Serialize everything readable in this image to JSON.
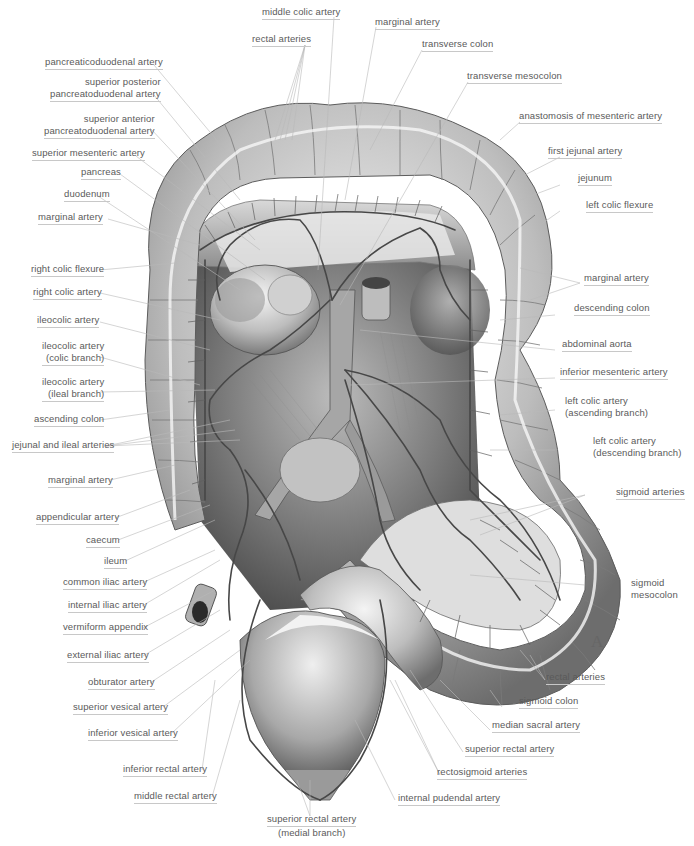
{
  "figure": {
    "panel_letter": "A",
    "style": "grayscale anatomical illustration of the large intestine and its arterial supply, anterior view",
    "colors": {
      "background": "#ffffff",
      "label_text": "#5a5a5a",
      "leader_line": "#b8b8b8",
      "tissue_light": "#e6e6e6",
      "tissue_dark": "#6a6a6a",
      "vessel": "#4a4a4a"
    }
  },
  "labels": {
    "left": [
      {
        "id": "pancreaticoduodenal-artery",
        "text": "pancreaticoduodenal artery"
      },
      {
        "id": "superior-posterior-pancreatoduodenal-artery",
        "line1": "superior posterior",
        "line2": "pancreatoduodenal artery"
      },
      {
        "id": "superior-anterior-pancreatoduodenal-artery",
        "line1": "superior anterior",
        "line2": "pancreatoduodenal artery"
      },
      {
        "id": "superior-mesenteric-artery",
        "text": "superior mesenteric artery"
      },
      {
        "id": "pancreas",
        "text": "pancreas"
      },
      {
        "id": "duodenum",
        "text": "duodenum"
      },
      {
        "id": "marginal-artery-left-upper",
        "text": "marginal artery"
      },
      {
        "id": "right-colic-flexure",
        "text": "right colic flexure"
      },
      {
        "id": "right-colic-artery",
        "text": "right colic artery"
      },
      {
        "id": "ileocolic-artery",
        "text": "ileocolic artery"
      },
      {
        "id": "ileocolic-artery-colic-branch",
        "line1": "ileocolic artery",
        "line2": "(colic branch)"
      },
      {
        "id": "ileocolic-artery-ileal-branch",
        "line1": "ileocolic artery",
        "line2": "(ileal branch)"
      },
      {
        "id": "ascending-colon",
        "text": "ascending colon"
      },
      {
        "id": "jejunal-and-ileal-arteries",
        "text": "jejunal and ileal arteries"
      },
      {
        "id": "marginal-artery-left-lower",
        "text": "marginal artery"
      },
      {
        "id": "appendicular-artery",
        "text": "appendicular artery"
      },
      {
        "id": "caecum",
        "text": "caecum"
      },
      {
        "id": "ileum",
        "text": "ileum"
      },
      {
        "id": "common-iliac-artery",
        "text": "common iliac artery"
      },
      {
        "id": "internal-iliac-artery",
        "text": "internal iliac artery"
      },
      {
        "id": "vermiform-appendix",
        "text": "vermiform appendix"
      },
      {
        "id": "external-iliac-artery",
        "text": "external iliac artery"
      },
      {
        "id": "obturator-artery",
        "text": "obturator artery"
      },
      {
        "id": "superior-vesical-artery",
        "text": "superior vesical artery"
      },
      {
        "id": "inferior-vesical-artery",
        "text": "inferior vesical artery"
      },
      {
        "id": "inferior-rectal-artery",
        "text": "inferior rectal artery"
      },
      {
        "id": "middle-rectal-artery",
        "text": "middle rectal artery"
      }
    ],
    "top": [
      {
        "id": "middle-colic-artery",
        "text": "middle colic artery"
      },
      {
        "id": "rectal-arteries-top",
        "text": "rectal arteries"
      },
      {
        "id": "marginal-artery-top",
        "text": "marginal artery"
      },
      {
        "id": "transverse-colon",
        "text": "transverse colon"
      },
      {
        "id": "transverse-mesocolon",
        "text": "transverse mesocolon"
      }
    ],
    "right": [
      {
        "id": "anastomosis-of-mesenteric-artery",
        "text": "anastomosis of mesenteric artery"
      },
      {
        "id": "first-jejunal-artery",
        "text": "first jejunal artery"
      },
      {
        "id": "jejunum",
        "text": "jejunum"
      },
      {
        "id": "left-colic-flexure",
        "text": "left colic flexure"
      },
      {
        "id": "marginal-artery-right",
        "text": "marginal artery"
      },
      {
        "id": "descending-colon",
        "text": "descending colon"
      },
      {
        "id": "abdominal-aorta",
        "text": "abdominal aorta"
      },
      {
        "id": "inferior-mesenteric-artery",
        "text": "inferior mesenteric artery"
      },
      {
        "id": "left-colic-artery-ascending-branch",
        "line1": "left colic artery",
        "line2": "(ascending branch)"
      },
      {
        "id": "left-colic-artery-descending-branch",
        "line1": "left colic artery",
        "line2": "(descending branch)"
      },
      {
        "id": "sigmoid-arteries",
        "text": "sigmoid arteries"
      },
      {
        "id": "sigmoid-mesocolon",
        "line1": "sigmoid",
        "line2": "mesocolon"
      },
      {
        "id": "rectal-arteries-bottom",
        "text": "rectal arteries"
      },
      {
        "id": "sigmoid-colon",
        "text": "sigmoid colon"
      },
      {
        "id": "median-sacral-artery",
        "text": "median sacral artery"
      },
      {
        "id": "superior-rectal-artery",
        "text": "superior rectal artery"
      },
      {
        "id": "rectosigmoid-arteries",
        "text": "rectosigmoid arteries"
      },
      {
        "id": "internal-pudendal-artery",
        "text": "internal pudendal artery"
      }
    ],
    "bottom": [
      {
        "id": "superior-rectal-artery-medial-branch",
        "line1": "superior rectal artery",
        "line2": "(medial branch)"
      }
    ]
  }
}
